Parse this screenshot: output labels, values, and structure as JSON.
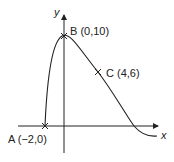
{
  "diagram": {
    "type": "function-graph",
    "axes": {
      "x_label": "x",
      "y_label": "y"
    },
    "points": [
      {
        "id": "A",
        "label": "A (−2,0)",
        "x": -2,
        "y": 0
      },
      {
        "id": "B",
        "label": "B (0,10)",
        "x": 0,
        "y": 10
      },
      {
        "id": "C",
        "label": "C (4,6)",
        "x": 4,
        "y": 6
      }
    ],
    "colors": {
      "stroke": "#222222",
      "background": "#ffffff"
    }
  }
}
